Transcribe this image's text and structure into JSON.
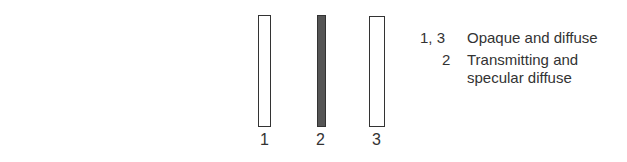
{
  "panels": [
    {
      "label": "1",
      "fill": "#ffffff"
    },
    {
      "label": "2",
      "fill": "#555555"
    },
    {
      "label": "3",
      "fill": "#ffffff"
    }
  ],
  "legend": [
    {
      "key": "1, 3",
      "line1": "Opaque and diffuse",
      "line2": ""
    },
    {
      "key": "2",
      "line1": "Transmitting and",
      "line2": "specular diffuse"
    }
  ]
}
